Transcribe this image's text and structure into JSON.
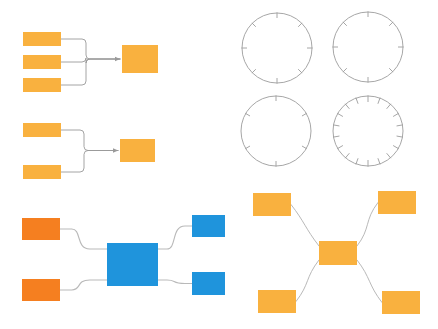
{
  "canvas": {
    "width": 438,
    "height": 329,
    "background": "#ffffff"
  },
  "palette": {
    "amber": "#f9b13f",
    "amber_light": "#fbb040",
    "orange": "#f57f20",
    "blue": "#1f94dc",
    "blue_dark": "#0d82cf",
    "connector": "#9a9a9a",
    "connector_light": "#b9b9b9",
    "circle_stroke": "#9c9c9c"
  },
  "clusters": [
    {
      "id": "cluster-funnel-three",
      "name": "three-to-one-funnel-diagram",
      "type": "funnel",
      "connector_style": "orthogonal",
      "arrow": true,
      "sources": [
        {
          "name": "source-node-1",
          "x": 23,
          "y": 32,
          "w": 38,
          "h": 14,
          "color": "#f9b13f"
        },
        {
          "name": "source-node-2",
          "x": 23,
          "y": 55,
          "w": 38,
          "h": 14,
          "color": "#f9b13f"
        },
        {
          "name": "source-node-3",
          "x": 23,
          "y": 78,
          "w": 38,
          "h": 14,
          "color": "#f9b13f"
        }
      ],
      "targets": [
        {
          "name": "target-node",
          "x": 122,
          "y": 45,
          "w": 36,
          "h": 28,
          "color": "#f9b13f"
        }
      ]
    },
    {
      "id": "cluster-funnel-two",
      "name": "two-to-one-funnel-diagram",
      "type": "funnel",
      "connector_style": "orthogonal",
      "arrow": true,
      "sources": [
        {
          "name": "source-node-1",
          "x": 23,
          "y": 123,
          "w": 38,
          "h": 14,
          "color": "#f9b13f"
        },
        {
          "name": "source-node-2",
          "x": 23,
          "y": 165,
          "w": 38,
          "h": 14,
          "color": "#f9b13f"
        }
      ],
      "targets": [
        {
          "name": "target-node",
          "x": 120,
          "y": 139,
          "w": 35,
          "h": 23,
          "color": "#f9b13f"
        }
      ]
    },
    {
      "id": "cluster-hub-blue",
      "name": "blue-hub-flow-diagram",
      "type": "hub",
      "connector_style": "curved-step",
      "arrow": false,
      "sources": [
        {
          "name": "input-node-1",
          "x": 22,
          "y": 218,
          "w": 38,
          "h": 22,
          "color": "#f57f20"
        },
        {
          "name": "input-node-2",
          "x": 22,
          "y": 279,
          "w": 38,
          "h": 22,
          "color": "#f57f20"
        }
      ],
      "hub": {
        "name": "hub-node",
        "x": 107,
        "y": 243,
        "w": 51,
        "h": 43,
        "color": "#1f94dc"
      },
      "targets": [
        {
          "name": "output-node-1",
          "x": 192,
          "y": 215,
          "w": 33,
          "h": 22,
          "color": "#1f94dc"
        },
        {
          "name": "output-node-2",
          "x": 192,
          "y": 272,
          "w": 33,
          "h": 23,
          "color": "#1f94dc"
        }
      ]
    },
    {
      "id": "cluster-hub-amber",
      "name": "amber-radial-hub-diagram",
      "type": "radial",
      "connector_style": "bezier",
      "arrow": false,
      "hub": {
        "name": "hub-node",
        "x": 319,
        "y": 241,
        "w": 38,
        "h": 24,
        "color": "#f9b13f"
      },
      "satellites": [
        {
          "name": "satellite-node-top-left",
          "x": 253,
          "y": 193,
          "w": 38,
          "h": 23,
          "color": "#f9b13f"
        },
        {
          "name": "satellite-node-top-right",
          "x": 378,
          "y": 191,
          "w": 38,
          "h": 23,
          "color": "#f9b13f"
        },
        {
          "name": "satellite-node-bottom-left",
          "x": 258,
          "y": 290,
          "w": 38,
          "h": 23,
          "color": "#f9b13f"
        },
        {
          "name": "satellite-node-bottom-right",
          "x": 382,
          "y": 291,
          "w": 38,
          "h": 23,
          "color": "#f9b13f"
        }
      ]
    }
  ],
  "dials": [
    {
      "name": "dial-8-tick-upper-left",
      "cx": 277,
      "cy": 48,
      "r": 35,
      "ticks": 8,
      "tick_len": 5,
      "stroke": "#9c9c9c"
    },
    {
      "name": "dial-8-tick-upper-right",
      "cx": 368,
      "cy": 47,
      "r": 35,
      "ticks": 8,
      "tick_len": 5,
      "stroke": "#9c9c9c"
    },
    {
      "name": "dial-6-tick-lower-left",
      "cx": 276,
      "cy": 131,
      "r": 35,
      "ticks": 6,
      "tick_len": 5,
      "stroke": "#9c9c9c"
    },
    {
      "name": "dial-18-tick-lower-right",
      "cx": 368,
      "cy": 131,
      "r": 35,
      "ticks": 18,
      "tick_len": 6,
      "stroke": "#9c9c9c"
    }
  ]
}
